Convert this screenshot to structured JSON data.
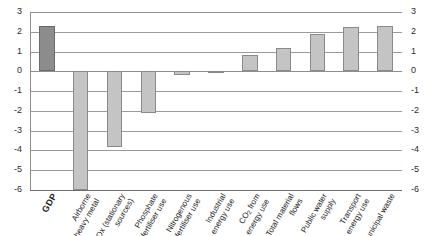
{
  "chart_data": {
    "type": "bar",
    "title": "",
    "subtitle": "",
    "xlabel": "",
    "ylabel": "",
    "ylim": [
      -6,
      3
    ],
    "ytick_labels": [
      "3",
      "2",
      "1",
      "0",
      "-1",
      "-2",
      "-3",
      "-4",
      "-5",
      "-6"
    ],
    "ytick_values": [
      3,
      2,
      1,
      0,
      -1,
      -2,
      -3,
      -4,
      -5,
      -6
    ],
    "grid": true,
    "legend": "none",
    "axis_labels_both_sides": true,
    "categories": [
      "GDP",
      "Airborne heavy metal",
      "SOx (stationary sources)",
      "Phosphate fertiliser use",
      "Nitrogenous fertiliser use",
      "Industrial energy use",
      "CO2 from energy use",
      "Total material flows",
      "Public water supply",
      "Transport energy use",
      "Municipal waste"
    ],
    "values": [
      2.3,
      -6.0,
      -3.85,
      -2.1,
      -0.2,
      -0.05,
      0.85,
      1.2,
      1.9,
      2.25,
      2.3
    ],
    "colors": {
      "bar_fill": "#c4c4c4",
      "bar_border": "#8a8a8a",
      "highlight_fill": "#8c8c8c",
      "highlight_border": "#6a6a6a",
      "gridline": "#9a9a9a",
      "text": "#1d1d1d"
    },
    "highlight_index": 0
  },
  "category_lines": [
    {
      "l1": "GDP",
      "l2": ""
    },
    {
      "l1": "Airborne",
      "l2": "heavy metal"
    },
    {
      "l1": "SOx (stationary",
      "l2": "sources)"
    },
    {
      "l1": "Phosphate",
      "l2": "fertiliser use"
    },
    {
      "l1": "Nitrogenous",
      "l2": "fertiliser use"
    },
    {
      "l1": "Industrial",
      "l2": "energy use"
    },
    {
      "l1": "CO₂ from",
      "l2": "energy use"
    },
    {
      "l1": "Total material",
      "l2": "flows"
    },
    {
      "l1": "Public water",
      "l2": "supply"
    },
    {
      "l1": "Transport",
      "l2": "energy use"
    },
    {
      "l1": "Municipal waste",
      "l2": ""
    }
  ]
}
